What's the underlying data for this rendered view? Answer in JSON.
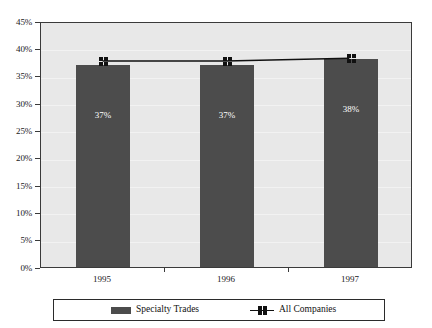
{
  "chart_data": {
    "type": "bar",
    "title": "",
    "xlabel": "",
    "ylabel": "",
    "categories": [
      "1995",
      "1996",
      "1997"
    ],
    "ylim": [
      0,
      45
    ],
    "ytick_values": [
      0,
      5,
      10,
      15,
      20,
      25,
      30,
      35,
      40,
      45
    ],
    "ytick_labels": [
      "0%",
      "5%",
      "10%",
      "15%",
      "20%",
      "25%",
      "30%",
      "35%",
      "40%",
      "45%"
    ],
    "grid": true,
    "legend_position": "bottom",
    "series": [
      {
        "name": "Specialty Trades",
        "type": "bar",
        "color": "#4c4c4c",
        "values": [
          37,
          37,
          38
        ],
        "data_labels": [
          "37%",
          "37%",
          "38%"
        ]
      },
      {
        "name": "All Companies",
        "type": "line",
        "color": "#111111",
        "marker": "square-cluster",
        "values": [
          38,
          38,
          38.5
        ],
        "data_labels": [
          "",
          "",
          ""
        ]
      }
    ]
  },
  "axes": {
    "y": {
      "ticks": [
        {
          "label": "45%",
          "value": 45
        },
        {
          "label": "40%",
          "value": 40
        },
        {
          "label": "35%",
          "value": 35
        },
        {
          "label": "30%",
          "value": 30
        },
        {
          "label": "25%",
          "value": 25
        },
        {
          "label": "20%",
          "value": 20
        },
        {
          "label": "15%",
          "value": 15
        },
        {
          "label": "10%",
          "value": 10
        },
        {
          "label": "5%",
          "value": 5
        },
        {
          "label": "0%",
          "value": 0
        }
      ]
    },
    "x": {
      "ticks": [
        {
          "label": "1995"
        },
        {
          "label": "1996"
        },
        {
          "label": "1997"
        }
      ]
    }
  },
  "bars": [
    {
      "category": "1995",
      "value": 37,
      "label": "37%"
    },
    {
      "category": "1996",
      "value": 37,
      "label": "37%"
    },
    {
      "category": "1997",
      "value": 38,
      "label": "38%"
    }
  ],
  "legend": {
    "items": [
      {
        "label": "Specialty Trades",
        "symbol": "swatch",
        "color": "#4c4c4c"
      },
      {
        "label": "All Companies",
        "symbol": "line-marker",
        "color": "#111111"
      }
    ]
  },
  "colors": {
    "bar": "#4c4c4c",
    "line": "#111111",
    "plot_background": "#e8e8e8",
    "page_background": "#ffffff",
    "axis": "#3a3a3a",
    "gridline": "#f2f2f2",
    "data_label": "#ffffff"
  }
}
